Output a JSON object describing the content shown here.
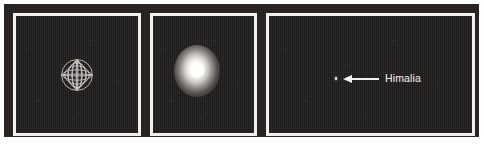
{
  "figure": {
    "kind": "astronomical-image-triptych",
    "background_color": "#ffffff",
    "plate_color": "#231f1f",
    "frame_color": "#f2f0ec"
  },
  "panels": [
    {
      "id": "globe",
      "name": "wireframe-globe-panel",
      "content_type": "wireframe-sphere",
      "sky_color": "#1e1b1c",
      "object_color": "#d8d4cf",
      "meridians": 6,
      "parallels": 5
    },
    {
      "id": "bright",
      "name": "saturated-source-panel",
      "content_type": "overexposed-glow",
      "sky_color": "#1e1b1c",
      "glow_color": "#ffffff"
    },
    {
      "id": "field",
      "name": "faint-moon-panel",
      "content_type": "star-field",
      "sky_color": "#1e1b1c",
      "annotation": {
        "label": "Himalia",
        "label_color": "#f6f4f0",
        "arrow_color": "#f4f2ee",
        "arrow_direction": "left"
      }
    }
  ]
}
